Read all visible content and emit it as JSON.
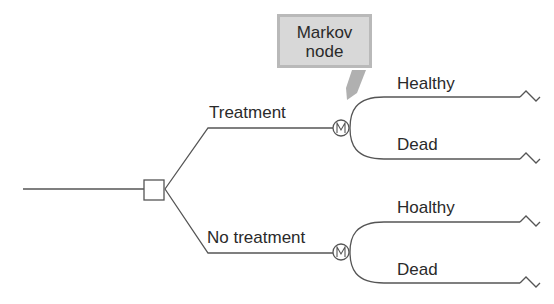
{
  "callout": {
    "line1": "Markov",
    "line2": "node"
  },
  "branches": {
    "treatment": {
      "label": "Treatment",
      "node": "M",
      "outcomes": [
        "Healthy",
        "Dead"
      ]
    },
    "no_treatment": {
      "label": "No treatment",
      "node": "M",
      "outcomes": [
        "Hoalthy",
        "Dead"
      ]
    }
  },
  "colors": {
    "line": "#555555",
    "callout_fill": "#d8d8d8",
    "callout_border": "#b9b9b9",
    "arrow": "#b0b0b0"
  }
}
